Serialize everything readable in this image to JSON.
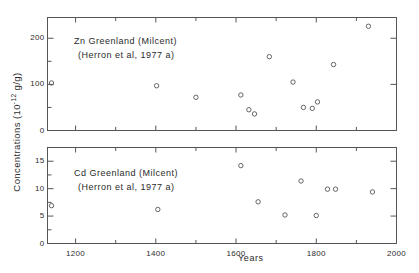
{
  "figure": {
    "y_axis_title": "Concentrations",
    "y_axis_units_prefix": "(10",
    "y_axis_units_exponent": "-12",
    "y_axis_units_suffix": " g/g)",
    "x_axis_title": "Years",
    "frame_color": "#555555",
    "marker_color": "#555555",
    "background": "#ffffff"
  },
  "chart_data": [
    {
      "type": "scatter",
      "id": "zn-panel",
      "title": "Zn  Greenland  (Milcent)",
      "subtitle": "(Herron et al, 1977 a)",
      "element": "Zn",
      "location": "Greenland",
      "site": "Milcent",
      "reference": "Herron et al, 1977 a",
      "xlabel": "Years",
      "ylabel": "Concentrations (10-12 g/g)",
      "xlim": [
        1130,
        2000
      ],
      "ylim": [
        0,
        245
      ],
      "xticks": [
        1200,
        1400,
        1600,
        1800,
        2000
      ],
      "xticklabels": [
        "1200",
        "1400",
        "1600",
        "1800",
        "2000"
      ],
      "xminorticks": [
        1300,
        1500,
        1700,
        1900
      ],
      "yticks": [
        0,
        100,
        200
      ],
      "yticklabels": [
        "0",
        "100",
        "200"
      ],
      "yminorticks": [
        50,
        150
      ],
      "grid": false,
      "legend": null,
      "points": [
        {
          "x": 1140,
          "y": 103
        },
        {
          "x": 1402,
          "y": 97
        },
        {
          "x": 1500,
          "y": 72
        },
        {
          "x": 1612,
          "y": 77
        },
        {
          "x": 1632,
          "y": 45
        },
        {
          "x": 1646,
          "y": 36
        },
        {
          "x": 1683,
          "y": 160
        },
        {
          "x": 1742,
          "y": 105
        },
        {
          "x": 1768,
          "y": 50
        },
        {
          "x": 1790,
          "y": 48
        },
        {
          "x": 1803,
          "y": 62
        },
        {
          "x": 1843,
          "y": 143
        },
        {
          "x": 1930,
          "y": 226
        }
      ]
    },
    {
      "type": "scatter",
      "id": "cd-panel",
      "title": "Cd  Greenland  (Milcent)",
      "subtitle": "(Herron et al, 1977 a)",
      "element": "Cd",
      "location": "Greenland",
      "site": "Milcent",
      "reference": "Herron et al, 1977 a",
      "xlabel": "Years",
      "ylabel": "Concentrations (10-12 g/g)",
      "xlim": [
        1130,
        2000
      ],
      "ylim": [
        0,
        17.5
      ],
      "xticks": [
        1200,
        1400,
        1600,
        1800,
        2000
      ],
      "xticklabels": [
        "1200",
        "1400",
        "1600",
        "1800",
        "2000"
      ],
      "xminorticks": [
        1300,
        1500,
        1700,
        1900
      ],
      "yticks": [
        0,
        5,
        10,
        15
      ],
      "yticklabels": [
        "0",
        "5",
        "10",
        "15"
      ],
      "yminorticks": [
        2.5,
        7.5,
        12.5
      ],
      "grid": false,
      "legend": null,
      "points": [
        {
          "x": 1140,
          "y": 6.9
        },
        {
          "x": 1405,
          "y": 6.2
        },
        {
          "x": 1612,
          "y": 14.2
        },
        {
          "x": 1655,
          "y": 7.6
        },
        {
          "x": 1722,
          "y": 5.2
        },
        {
          "x": 1762,
          "y": 11.4
        },
        {
          "x": 1800,
          "y": 5.1
        },
        {
          "x": 1828,
          "y": 9.9
        },
        {
          "x": 1848,
          "y": 9.9
        },
        {
          "x": 1940,
          "y": 9.4
        }
      ]
    }
  ]
}
